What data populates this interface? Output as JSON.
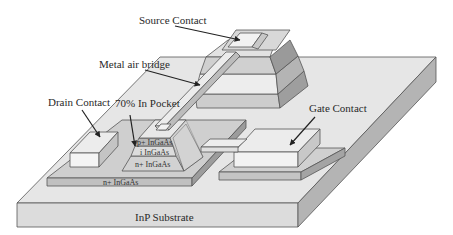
{
  "diagram": {
    "type": "3d-device-cross-section",
    "labels": {
      "source_contact": "Source Contact",
      "metal_air_bridge": "Metal air bridge",
      "drain_contact": "Drain Contact",
      "pocket": "70% In Pocket",
      "gate_contact": "Gate Contact",
      "substrate": "InP Substrate"
    },
    "layers": {
      "p_layer": "p+ InGaAs",
      "i_layer": "i InGaAs",
      "n_layer": "n+ InGaAs",
      "n_base": "n+ InGaAs"
    },
    "colors": {
      "substrate_top": "#e6e6e6",
      "substrate_front": "#dcdcdc",
      "substrate_side": "#b4b4b4",
      "layer_light": "#e2e2e2",
      "layer_mid": "#c8c8c8",
      "layer_dark": "#a8a8a8",
      "contact": "#f2f2f2",
      "outline": "#555555"
    }
  }
}
